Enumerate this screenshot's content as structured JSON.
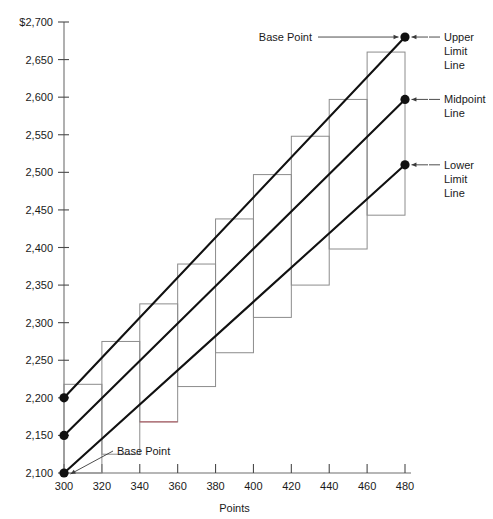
{
  "chart_data": {
    "type": "line",
    "title": "",
    "xlabel": "Points",
    "ylabel": "",
    "xlim": [
      300,
      480
    ],
    "ylim": [
      2100,
      2700
    ],
    "grid": false,
    "legend_position": "right-annotations",
    "x_ticks": [
      300,
      320,
      340,
      360,
      380,
      400,
      420,
      440,
      460,
      480
    ],
    "x_tick_labels": [
      "300",
      "320",
      "340",
      "360",
      "380",
      "400",
      "420",
      "440",
      "460",
      "480"
    ],
    "y_ticks": [
      2100,
      2150,
      2200,
      2250,
      2300,
      2350,
      2400,
      2450,
      2500,
      2550,
      2600,
      2650,
      2700
    ],
    "y_tick_labels": [
      "2,100",
      "2,150",
      "2,200",
      "2,250",
      "2,300",
      "2,350",
      "2,400",
      "2,450",
      "2,500",
      "2,550",
      "2,600",
      "2,650",
      "$2,700"
    ],
    "series": [
      {
        "name": "Upper Limit Line",
        "color": "#111111",
        "x": [
          300,
          480
        ],
        "values": [
          2200,
          2680
        ],
        "base_point": {
          "x": 300,
          "y": 2200
        },
        "end_point": {
          "x": 480,
          "y": 2680
        }
      },
      {
        "name": "Midpoint Line",
        "color": "#111111",
        "x": [
          300,
          480
        ],
        "values": [
          2150,
          2597
        ],
        "base_point": {
          "x": 300,
          "y": 2150
        },
        "end_point": {
          "x": 480,
          "y": 2597
        }
      },
      {
        "name": "Lower Limit Line",
        "color": "#111111",
        "x": [
          300,
          480
        ],
        "values": [
          2100,
          2510
        ],
        "base_point": {
          "x": 300,
          "y": 2100
        },
        "end_point": {
          "x": 480,
          "y": 2510
        }
      }
    ],
    "grade_ranges": [
      {
        "grade": 1,
        "x_start": 300,
        "x_end": 320,
        "y_bottom": 2100,
        "y_top": 2218,
        "highlight": false
      },
      {
        "grade": 2,
        "x_start": 320,
        "x_end": 340,
        "y_bottom": 2125,
        "y_top": 2275,
        "highlight": false
      },
      {
        "grade": 3,
        "x_start": 340,
        "x_end": 360,
        "y_bottom": 2168,
        "y_top": 2325,
        "highlight": true
      },
      {
        "grade": 4,
        "x_start": 360,
        "x_end": 380,
        "y_bottom": 2215,
        "y_top": 2378,
        "highlight": false
      },
      {
        "grade": 5,
        "x_start": 380,
        "x_end": 400,
        "y_bottom": 2260,
        "y_top": 2438,
        "highlight": false
      },
      {
        "grade": 6,
        "x_start": 400,
        "x_end": 420,
        "y_bottom": 2307,
        "y_top": 2497,
        "highlight": false
      },
      {
        "grade": 7,
        "x_start": 420,
        "x_end": 440,
        "y_bottom": 2350,
        "y_top": 2548,
        "highlight": false
      },
      {
        "grade": 8,
        "x_start": 440,
        "x_end": 460,
        "y_bottom": 2398,
        "y_top": 2597,
        "highlight": false
      },
      {
        "grade": 9,
        "x_start": 460,
        "x_end": 480,
        "y_bottom": 2443,
        "y_top": 2660,
        "highlight": false
      }
    ],
    "annotations": [
      {
        "id": "base-point-top",
        "text": "Base Point",
        "target_x": 480,
        "target_y": 2680,
        "placement": "left"
      },
      {
        "id": "base-point-bottom",
        "text": "Base Point",
        "target_x": 300,
        "target_y": 2100,
        "placement": "right"
      },
      {
        "id": "upper-limit-line",
        "text": "Upper Limit Line",
        "lines": [
          "Upper",
          "Limit",
          "Line"
        ],
        "target_x": 480,
        "target_y": 2680,
        "placement": "right"
      },
      {
        "id": "midpoint-line",
        "text": "Midpoint Line",
        "lines": [
          "Midpoint",
          "Line"
        ],
        "target_x": 480,
        "target_y": 2597,
        "placement": "right"
      },
      {
        "id": "lower-limit-line",
        "text": "Lower Limit Line",
        "lines": [
          "Lower",
          "Limit",
          "Line"
        ],
        "target_x": 480,
        "target_y": 2510,
        "placement": "right"
      }
    ]
  },
  "axis": {
    "x_title": "Points",
    "y_top_label": "$2,700"
  },
  "colors": {
    "line": "#111111",
    "band": "#8c8c8c",
    "band_highlight": "#b3565f",
    "axis": "#6f6f6f",
    "text": "#1a1a1a"
  }
}
